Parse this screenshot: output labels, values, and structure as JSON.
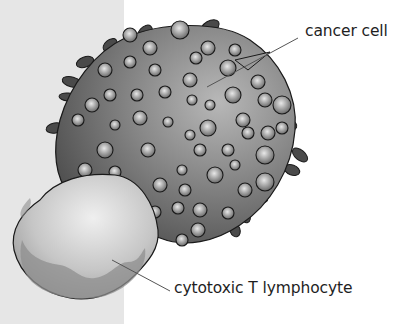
{
  "diagram": {
    "labels": {
      "cancer_cell": "cancer cell",
      "t_cell": "cytotoxic T lymphocyte"
    },
    "colors": {
      "side_panel": "#e6e6e6",
      "background": "#ffffff",
      "cancer_cell_dark": "#4a4a4a",
      "cancer_cell_light": "#9a9a9a",
      "t_cell_body": "#c8c8c8",
      "outline": "#1a1a1a",
      "leader_line": "#555555"
    }
  }
}
